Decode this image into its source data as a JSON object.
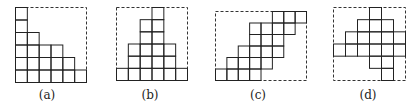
{
  "figure": {
    "panels": [
      {
        "id": "a",
        "label": "(a)",
        "frame": {
          "x": 15,
          "y": 7,
          "w": 71,
          "h": 75
        },
        "cols": 6,
        "rows": 6,
        "label_pos": {
          "x": 47,
          "y": 88
        },
        "cells_by_row_from_top": [
          [
            1
          ],
          [
            1
          ],
          [
            1,
            2
          ],
          [
            1,
            2,
            3,
            4
          ],
          [
            1,
            2,
            3,
            4,
            5
          ],
          [
            1,
            2,
            3,
            4,
            5,
            6
          ]
        ]
      },
      {
        "id": "b",
        "label": "(b)",
        "frame": {
          "x": 116,
          "y": 7,
          "w": 71,
          "h": 73
        },
        "cols": 6,
        "rows": 6,
        "label_pos": {
          "x": 150,
          "y": 88
        },
        "cells_by_row_from_top": [
          [
            4
          ],
          [
            3,
            4
          ],
          [
            3,
            4
          ],
          [
            2,
            3,
            4,
            5
          ],
          [
            2,
            3,
            4,
            5
          ],
          [
            1,
            2,
            3,
            4,
            5,
            6
          ]
        ]
      },
      {
        "id": "c",
        "label": "(c)",
        "frame": {
          "x": 215,
          "y": 11,
          "w": 91,
          "h": 69
        },
        "cols": 8,
        "rows": 6,
        "label_pos": {
          "x": 258,
          "y": 88
        },
        "cells_by_row_from_top": [
          [
            6,
            7,
            8
          ],
          [
            4,
            5,
            6,
            7
          ],
          [
            4,
            5,
            6
          ],
          [
            3,
            4,
            5,
            6
          ],
          [
            2,
            3,
            4,
            5
          ],
          [
            1,
            2,
            3,
            4
          ]
        ]
      },
      {
        "id": "d",
        "label": "(d)",
        "frame": {
          "x": 333,
          "y": 7,
          "w": 72,
          "h": 73
        },
        "cols": 6,
        "rows": 6,
        "label_pos": {
          "x": 368,
          "y": 88
        },
        "cells_by_row_from_top": [
          [
            4
          ],
          [
            3,
            4,
            5
          ],
          [
            2,
            3,
            4,
            5,
            6
          ],
          [
            1,
            2,
            3,
            4,
            5,
            6
          ],
          [
            4,
            5
          ],
          [
            5
          ]
        ]
      }
    ]
  }
}
